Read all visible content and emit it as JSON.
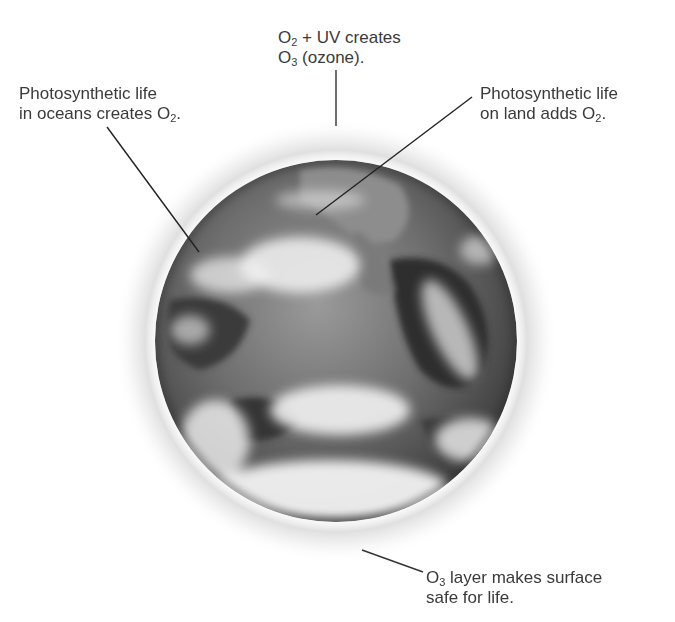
{
  "figure": {
    "type": "annotated-photo-diagram",
    "globe": {
      "center_x": 336,
      "center_y": 341,
      "radius": 181,
      "style": "grayscale satellite image with cloud cover",
      "halo": "soft gray ozone layer ring"
    },
    "labels": {
      "top": {
        "line1_pre": "O",
        "line1_sub": "2",
        "line1_post": " + UV creates",
        "line2_pre": "O",
        "line2_sub": "3",
        "line2_post": " (ozone)."
      },
      "left": {
        "line1": "Photosynthetic life",
        "line2_pre": "in oceans creates O",
        "line2_sub": "2",
        "line2_post": "."
      },
      "right": {
        "line1": "Photosynthetic life",
        "line2_pre": "on land adds O",
        "line2_sub": "2",
        "line2_post": "."
      },
      "bottom": {
        "line1_pre": "O",
        "line1_sub": "3",
        "line1_post": " layer makes surface",
        "line2": "safe for life."
      }
    },
    "leader_lines": [
      {
        "name": "top-ozone",
        "x1": 336,
        "y1": 70,
        "x2": 336,
        "y2": 126
      },
      {
        "name": "left-oceans",
        "x1": 107,
        "y1": 127,
        "x2": 199,
        "y2": 252
      },
      {
        "name": "right-land",
        "x1": 472,
        "y1": 97,
        "x2": 316,
        "y2": 215
      },
      {
        "name": "bottom-layer",
        "x1": 362,
        "y1": 550,
        "x2": 423,
        "y2": 572
      }
    ],
    "caption_cutoff": "Figure (caption cut off at bottom edge)"
  }
}
